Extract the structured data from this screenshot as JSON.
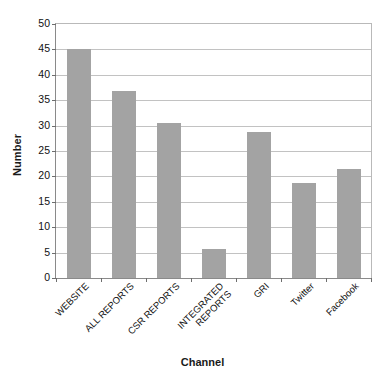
{
  "chart_data": {
    "type": "bar",
    "title": "",
    "xlabel": "Channel",
    "ylabel": "Number",
    "categories": [
      "WEBSITE",
      "ALL REPORTS",
      "CSR REPORTS",
      "INTEGRATED REPORTS",
      "GRI",
      "Twitter",
      "Facebook"
    ],
    "category_lines": [
      [
        "WEBSITE"
      ],
      [
        "ALL REPORTS"
      ],
      [
        "CSR REPORTS"
      ],
      [
        "INTEGRATED",
        "REPORTS"
      ],
      [
        "GRI"
      ],
      [
        "Twitter"
      ],
      [
        "Facebook"
      ]
    ],
    "values": [
      45,
      36.8,
      30.6,
      5.7,
      28.7,
      18.7,
      21.5
    ],
    "ylim": [
      0,
      50
    ],
    "yticks": [
      0,
      5,
      10,
      15,
      20,
      25,
      30,
      35,
      40,
      45,
      50
    ],
    "ytick_labels": [
      "0",
      "5",
      "10",
      "15",
      "20",
      "25",
      "30",
      "35",
      "40",
      "45",
      "50"
    ],
    "grid": true,
    "legend": false,
    "bar_color": "#a3a3a3",
    "background_color": "#ffffff",
    "axis_color": "#6e6e6e",
    "gridline_color": "#c2c2c2",
    "label_rotation_deg": -45
  }
}
